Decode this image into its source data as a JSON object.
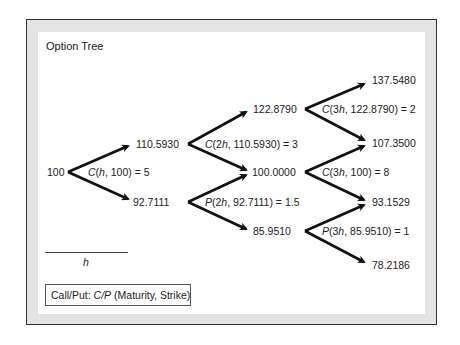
{
  "title": "Option Tree",
  "nodes": {
    "n0": "100",
    "n1u": "110.5930",
    "n1d": "92.7111",
    "n2uu": "122.8790",
    "n2ud": "100.0000",
    "n2dd": "85.9510",
    "n3uuu": "137.5480",
    "n3uud": "107.3500",
    "n3udd": "93.1529",
    "n3ddd": "78.2186"
  },
  "option_labels": {
    "l0": {
      "type": "C",
      "args": "(h, 100) = 5",
      "pre": "(",
      "mat": "h",
      "post": ", 100) = 5"
    },
    "l1u": {
      "type": "C",
      "pre": "(2",
      "mat": "h",
      "post": ", 110.5930) = 3"
    },
    "l1d": {
      "type": "P",
      "pre": "(2",
      "mat": "h",
      "post": ", 92.7111) = 1.5"
    },
    "l2uu": {
      "type": "C",
      "pre": "(3",
      "mat": "h",
      "post": ", 122.8790) = 2"
    },
    "l2ud": {
      "type": "C",
      "pre": "(3",
      "mat": "h",
      "post": ", 100) = 8"
    },
    "l2dd": {
      "type": "P",
      "pre": "(3",
      "mat": "h",
      "post": ", 85.9510) = 1"
    }
  },
  "scale": {
    "label": "h"
  },
  "legend": {
    "prefix": "Call/Put: ",
    "cp": "C/P",
    "suffix": " (Maturity, Strike)"
  }
}
